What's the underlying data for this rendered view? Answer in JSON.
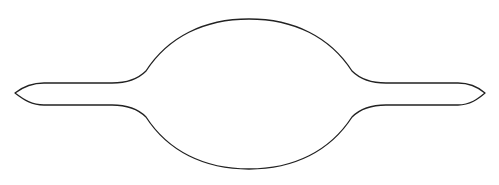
{
  "figure": {
    "kind": "outline-shape",
    "stroke_color": "#222222",
    "fill_color": "#ffffff",
    "background_color": "#ffffff",
    "stroke_width": 1.3
  }
}
